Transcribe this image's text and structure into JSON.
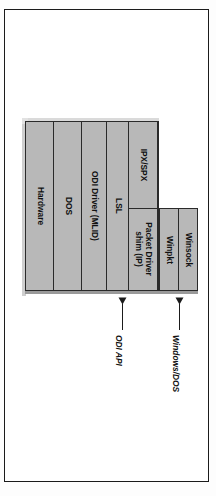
{
  "figure": {
    "orientation": "rotated-90-ccw",
    "colors": {
      "panel_fill": "#b8b8b8",
      "panel_border": "#2a2a2a",
      "bevel_light": "#dadada",
      "shadow": "#9a9a9a",
      "frame_border": "#1b1b1b",
      "text": "#111111",
      "page_background": "#ffffff"
    },
    "stack": {
      "upper_row": [
        {
          "id": "hardware",
          "label": "Hardware"
        },
        {
          "id": "dos",
          "label": "DOS"
        },
        {
          "id": "odi-driver",
          "label": "ODI Driver (MLID)"
        },
        {
          "id": "lsl",
          "label": "LSL"
        },
        {
          "id": "protocols",
          "split": true,
          "upper_label": "IPX/SPX",
          "lower_label": "Packet Driver shim (IP)"
        }
      ],
      "lower_row": [
        {
          "id": "winpkt",
          "label": "Winpkt"
        },
        {
          "id": "winsock",
          "label": "Winsock"
        }
      ]
    },
    "annotations": [
      {
        "id": "odi-api",
        "label": "ODI API"
      },
      {
        "id": "windows-dos",
        "label": "Windows/DOS"
      }
    ]
  }
}
